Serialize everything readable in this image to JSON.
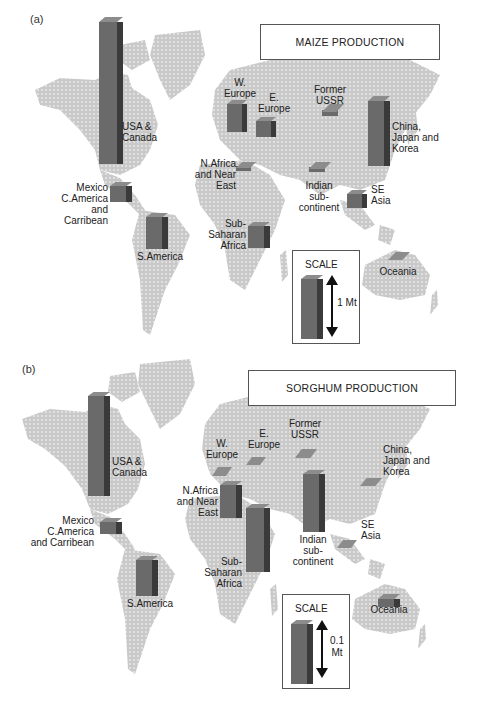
{
  "panels": {
    "a": {
      "label": "(a)",
      "title": "MAIZE PRODUCTION",
      "scale_title": "SCALE",
      "scale_value": "1 Mt",
      "regions": {
        "usa": "USA & Canada",
        "w_europe": "W. Europe",
        "e_europe": "E. Europe",
        "ussr": "Former USSR",
        "china": "China, Japan and Korea",
        "nafrica": "N.Africa and Near East",
        "mexico": "Mexico C.America and Carribean",
        "india": "Indian sub- continent",
        "se_asia": "SE Asia",
        "ssa": "Sub- Saharan Africa",
        "s_america": "S.America",
        "oceania": "Oceania"
      }
    },
    "b": {
      "label": "(b)",
      "title": "SORGHUM PRODUCTION",
      "scale_title": "SCALE",
      "scale_value": "0.1 Mt",
      "regions": {
        "usa": "USA & Canada",
        "w_europe": "W. Europe",
        "e_europe": "E. Europe",
        "ussr": "Former USSR",
        "china": "China, Japan and Korea",
        "nafrica": "N.Africa and Near East",
        "mexico": "Mexico C.America and Carribean",
        "india": "Indian sub- continent",
        "se_asia": "SE Asia",
        "ssa": "Sub- Saharan Africa",
        "s_america": "S.America",
        "oceania": "Oceania"
      }
    }
  },
  "chart_data": [
    {
      "type": "bar",
      "title": "MAIZE PRODUCTION",
      "panel": "(a)",
      "scale": "bar height of scale block = 1 Mt",
      "categories": [
        "USA & Canada",
        "W. Europe",
        "E. Europe",
        "Former USSR",
        "China, Japan and Korea",
        "N.Africa and Near East",
        "Mexico C.America and Carribean",
        "Indian sub-continent",
        "SE Asia",
        "Sub-Saharan Africa",
        "S.America",
        "Oceania"
      ],
      "values_relative_to_scale": [
        2.5,
        0.5,
        0.3,
        0.05,
        1.4,
        0.1,
        0.3,
        0.1,
        0.3,
        0.4,
        0.5,
        0.02
      ],
      "unit": "Mt (scale units)"
    },
    {
      "type": "bar",
      "title": "SORGHUM PRODUCTION",
      "panel": "(b)",
      "scale": "bar height of scale block = 0.1 Mt",
      "categories": [
        "USA & Canada",
        "W. Europe",
        "E. Europe",
        "Former USSR",
        "China, Japan and Korea",
        "N.Africa and Near East",
        "Mexico C.America and Carribean",
        "Indian sub-continent",
        "SE Asia",
        "Sub-Saharan Africa",
        "S.America",
        "Oceania"
      ],
      "values_relative_to_scale": [
        1.7,
        0.03,
        0.02,
        0.03,
        0.02,
        0.6,
        0.2,
        1.5,
        0.02,
        1.9,
        0.6,
        0.1
      ],
      "unit": "x 0.1 Mt (scale units)"
    }
  ]
}
